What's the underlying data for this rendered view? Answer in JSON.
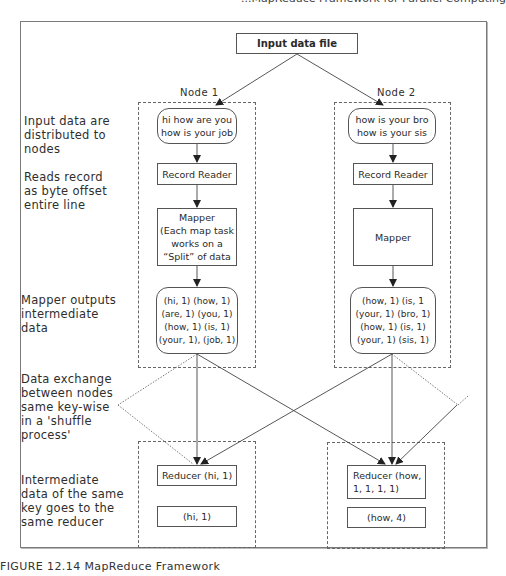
{
  "header": {
    "cut_text": "...MapReduce Framework for Parallel Computing"
  },
  "diagram": {
    "title_box": "Input data file",
    "row_labels": [
      "Input data are\ndistributed to\nnodes",
      "Reads record\nas byte offset\nentire line",
      "Mapper outputs\nintermediate\ndata",
      "Data exchange\nbetween nodes\nsame key-wise\nin a 'shuffle\nprocess'",
      "Intermediate\ndata of the same\nkey goes to the\nsame reducer"
    ],
    "nodes": [
      {
        "name": "Node 1",
        "input": "hi how are you\nhow is your job",
        "record_reader": "Record Reader",
        "mapper": "Mapper\n(Each map task\nworks on a\n“Split” of data",
        "mapper_output": "(hi, 1) (how, 1)\n(are, 1) (you, 1)\n(how, 1) (is, 1)\n(your, 1), (job, 1)",
        "reducer": "Reducer (hi, 1)",
        "result": "(hi, 1)"
      },
      {
        "name": "Node 2",
        "input": "how is your bro\nhow is your sis",
        "record_reader": "Record Reader",
        "mapper": "Mapper",
        "mapper_output": "(how, 1) (is, 1\n(your, 1) (bro, 1)\n(how, 1) (is, 1)\n(your, 1) (sis, 1)",
        "reducer": "Reducer (how,\n1, 1, 1, 1)",
        "result": "(how, 4)"
      }
    ]
  },
  "caption": "FIGURE 12.14   MapReduce Framework",
  "colors": {
    "stroke": "#555555",
    "dashed": "#666666",
    "text": "#2a2a2a"
  }
}
